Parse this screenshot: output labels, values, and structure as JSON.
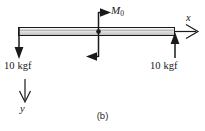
{
  "figure": {
    "caption": "(b)",
    "type": "free-body-diagram"
  },
  "beam": {
    "label": "beam",
    "fill_top": "#f2f2f2",
    "fill_bottom": "#b8b8b8",
    "stroke": "#1a1a1a"
  },
  "loads": {
    "left_force": {
      "label": "10 kgf",
      "direction": "down",
      "arrowhead": "solid"
    },
    "right_force": {
      "label": "10 kgf",
      "direction": "up",
      "arrowhead": "solid"
    },
    "moment": {
      "label": "M",
      "subscript": "0",
      "direction": "couple",
      "top_arrow": "right",
      "bottom_arrow": "left",
      "arrowhead": "solid"
    }
  },
  "axes": {
    "x": {
      "label": "x",
      "direction": "right",
      "arrowhead": "open"
    },
    "y": {
      "label": "y",
      "direction": "down",
      "arrowhead": "open"
    }
  },
  "colors": {
    "ink": "#1a1a1a",
    "background": "#ffffff"
  }
}
